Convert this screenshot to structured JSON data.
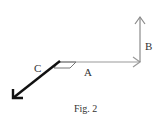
{
  "figure": {
    "caption": "Fig. 2",
    "vectors": [
      {
        "label": "A",
        "direction": "right",
        "color": "#8a8a8a"
      },
      {
        "label": "B",
        "direction": "up",
        "color": "#8a8a8a"
      },
      {
        "label": "C",
        "direction": "down-left",
        "color": "#111111"
      }
    ]
  }
}
